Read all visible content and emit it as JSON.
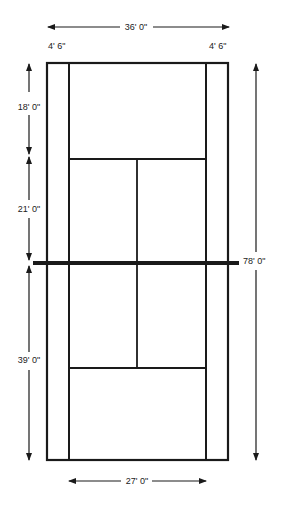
{
  "diagram": {
    "colors": {
      "line": "#1a1a1a",
      "background": "#ffffff"
    },
    "labels": {
      "total_width": "36' 0\"",
      "alley_left": "4' 6\"",
      "alley_right": "4' 6\"",
      "backcourt": "18' 0\"",
      "service_box": "21' 0\"",
      "half_court": "39' 0\"",
      "total_length": "78' 0\"",
      "singles_width": "27' 0\""
    }
  }
}
